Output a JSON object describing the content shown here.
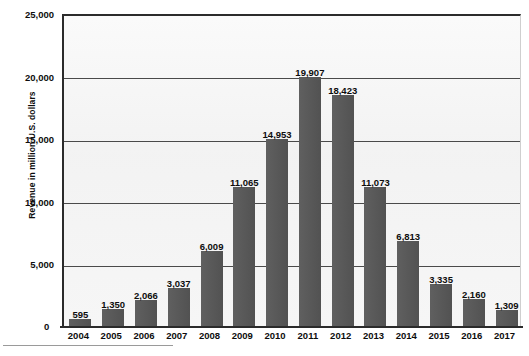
{
  "chart_data": {
    "type": "bar",
    "title": "",
    "xlabel": "",
    "ylabel": "Revenue in million U.S. dollars",
    "ylim": [
      0,
      25000
    ],
    "ytick_values": [
      0,
      5000,
      10000,
      15000,
      20000,
      25000
    ],
    "ytick_labels": [
      "0",
      "5,000",
      "10,000",
      "15,000",
      "20,000",
      "25,000"
    ],
    "grid": true,
    "legend": "none",
    "bar_color": "#575757",
    "plot_background": "#f4f4f4",
    "categories": [
      "2004",
      "2005",
      "2006",
      "2007",
      "2008",
      "2009",
      "2010",
      "2011",
      "2012",
      "2013",
      "2014",
      "2015",
      "2016",
      "2017"
    ],
    "values": [
      595,
      1350,
      2066,
      3037,
      6009,
      11065,
      14953,
      19907,
      18423,
      11073,
      6813,
      3335,
      2160,
      1309
    ],
    "value_labels": [
      "595",
      "1,350",
      "2,066",
      "3,037",
      "6,009",
      "11,065",
      "14,953",
      "19,907",
      "18,423",
      "11,073",
      "6,813",
      "3,335",
      "2,160",
      "1,309"
    ]
  }
}
